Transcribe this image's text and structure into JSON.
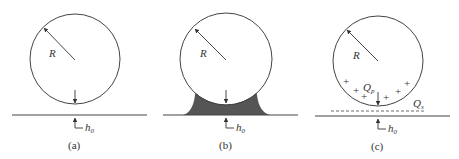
{
  "panels": [
    {
      "id": "a",
      "caption": "(a)",
      "radius_label": "R",
      "gap_label": "h",
      "gap_sub": "0",
      "meniscus": false,
      "charges": false
    },
    {
      "id": "b",
      "caption": "(b)",
      "radius_label": "R",
      "gap_label": "h",
      "gap_sub": "0",
      "meniscus": true,
      "charges": false
    },
    {
      "id": "c",
      "caption": "(c)",
      "radius_label": "R",
      "gap_label": "h",
      "gap_sub": "0",
      "meniscus": false,
      "charges": true,
      "particle_charge_label": "Q",
      "particle_charge_sub": "p",
      "surface_charge_label": "Q",
      "surface_charge_sub": "s",
      "charge_symbol": "+"
    }
  ],
  "colors": {
    "line": "#444444",
    "meniscus_fill": "#555555",
    "background": "#ffffff"
  }
}
